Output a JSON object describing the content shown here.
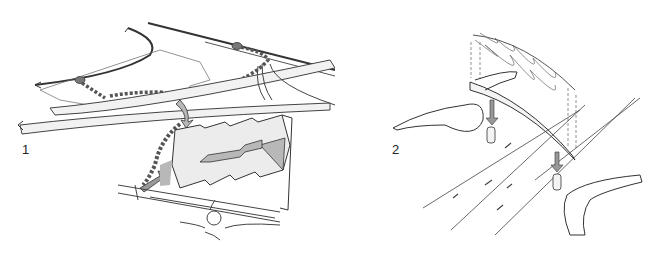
{
  "figure": {
    "panels": [
      {
        "number": "1",
        "description": "Perspective site sketch: roads with directional arrows, green corridor of vegetation linking roundabouts, pedestrian bridge arrow over highway, stepped building blocks on plot with entrance arrows, roundabout at bottom"
      },
      {
        "number": "2",
        "description": "Exploded sketch of curved footbridge deck over multi-lane road, mesh canopy above with dashed placement guides, support piers with downward arrows, landscape embankments on both sides, traffic direction arrows on lanes"
      }
    ]
  },
  "colors": {
    "line": "#333333",
    "road_fill": "#f2f2f2",
    "building_fill": "#ececec",
    "shade_fill": "#b8b8b8",
    "vegetation": "#555555",
    "background": "#ffffff"
  }
}
